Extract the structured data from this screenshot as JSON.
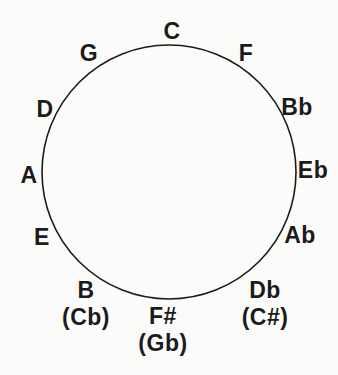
{
  "diagram": {
    "kind": "circle-of-fifths",
    "notes": [
      {
        "position": 0,
        "label": "C",
        "enharmonic": ""
      },
      {
        "position": 1,
        "label": "F",
        "enharmonic": ""
      },
      {
        "position": 2,
        "label": "Bb",
        "enharmonic": ""
      },
      {
        "position": 3,
        "label": "Eb",
        "enharmonic": ""
      },
      {
        "position": 4,
        "label": "Ab",
        "enharmonic": ""
      },
      {
        "position": 5,
        "label": "Db",
        "enharmonic": "(C#)"
      },
      {
        "position": 6,
        "label": "F#",
        "enharmonic": "(Gb)"
      },
      {
        "position": 7,
        "label": "B",
        "enharmonic": "(Cb)"
      },
      {
        "position": 8,
        "label": "E",
        "enharmonic": ""
      },
      {
        "position": 9,
        "label": "A",
        "enharmonic": ""
      },
      {
        "position": 10,
        "label": "D",
        "enharmonic": ""
      },
      {
        "position": 11,
        "label": "G",
        "enharmonic": ""
      }
    ],
    "colors": {
      "ink": "#1b1b1b",
      "background": "#fbfbfa"
    }
  }
}
